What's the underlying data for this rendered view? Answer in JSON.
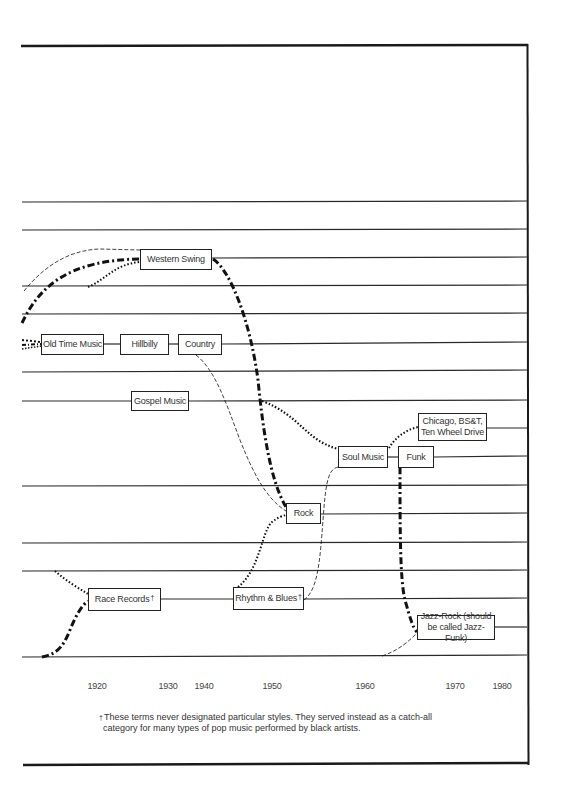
{
  "diagram": {
    "title": "",
    "styles": [
      {
        "id": "western_swing",
        "label": "Western Swing"
      },
      {
        "id": "old_time_music",
        "label": "Old Time Music"
      },
      {
        "id": "hillbilly",
        "label": "Hillbilly"
      },
      {
        "id": "country",
        "label": "Country"
      },
      {
        "id": "gospel_music",
        "label": "Gospel Music"
      },
      {
        "id": "soul_music",
        "label": "Soul Music"
      },
      {
        "id": "chicago",
        "label_line1": "Chicago, BS&T,",
        "label_line2": "Ten Wheel Drive"
      },
      {
        "id": "funk",
        "label": "Funk"
      },
      {
        "id": "rock",
        "label": "Rock"
      },
      {
        "id": "race_records",
        "label": "Race Records",
        "mark": "†"
      },
      {
        "id": "rhythm_blues",
        "label": "Rhythm & Blues",
        "mark": "†"
      },
      {
        "id": "jazz_rock",
        "label_line1": "Jazz-Rock (should",
        "label_line2": "be called Jazz-Funk)"
      }
    ],
    "timeline": {
      "years": [
        "1920",
        "1930",
        "1940",
        "1950",
        "1960",
        "1970",
        "1980"
      ]
    },
    "footnote": {
      "mark": "†",
      "line1": "These terms never designated particular styles. They served instead as a catch-all",
      "line2": "category for many types of pop music performed by black artists."
    },
    "connections": [
      {
        "from": "left-edge",
        "to": "western_swing",
        "style": "dash-dot"
      },
      {
        "from": "left-edge",
        "to": "western_swing",
        "style": "dashed"
      },
      {
        "from": "left-edge",
        "to": "western_swing",
        "style": "dotted"
      },
      {
        "from": "old_time_music",
        "to": "hillbilly",
        "style": "solid"
      },
      {
        "from": "hillbilly",
        "to": "country",
        "style": "solid"
      },
      {
        "from": "western_swing",
        "to": "rock",
        "style": "dash-dot"
      },
      {
        "from": "country",
        "to": "rock",
        "style": "dashed"
      },
      {
        "from": "gospel_music",
        "to": "soul_music",
        "style": "dotted"
      },
      {
        "from": "rhythm_blues",
        "to": "rock",
        "style": "dotted"
      },
      {
        "from": "rhythm_blues",
        "to": "soul_music",
        "style": "dashed"
      },
      {
        "from": "soul_music",
        "to": "funk",
        "style": "solid"
      },
      {
        "from": "soul_music",
        "to": "chicago",
        "style": "dotted"
      },
      {
        "from": "funk",
        "to": "jazz_rock",
        "style": "dash-dot"
      },
      {
        "from": "bottom-line",
        "to": "jazz_rock",
        "style": "dashed"
      },
      {
        "from": "left-edge",
        "to": "race_records",
        "style": "dotted"
      },
      {
        "from": "bottom-line",
        "to": "race_records",
        "style": "dash-dot"
      },
      {
        "from": "race_records",
        "to": "rhythm_blues",
        "style": "solid"
      }
    ]
  }
}
